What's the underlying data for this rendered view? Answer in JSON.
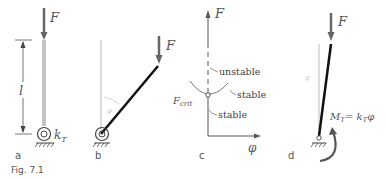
{
  "figure": {
    "caption": "Fig. 7.1",
    "panels": [
      {
        "id": "a",
        "label": "a",
        "force": "F",
        "length": "l",
        "spring": "k",
        "spring_sub": "T"
      },
      {
        "id": "b",
        "label": "b",
        "force": "F",
        "angle": "φ"
      },
      {
        "id": "c",
        "label": "c",
        "y_axis": "F",
        "x_axis": "φ",
        "critical": "F",
        "critical_sub": "crit",
        "branches": [
          "unstable",
          "stable",
          "stable"
        ]
      },
      {
        "id": "d",
        "label": "d",
        "force": "F",
        "angle": "φ",
        "moment": "M",
        "moment_sub": "T",
        "moment_eq": "= k",
        "moment_eq_sub": "T",
        "moment_var": "φ"
      }
    ]
  },
  "colors": {
    "bar": "#111111",
    "arrow": "#555555",
    "text": "#555555",
    "thin": "#999999",
    "curve": "#777777"
  }
}
